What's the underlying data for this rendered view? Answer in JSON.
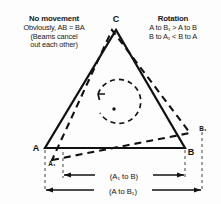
{
  "diagram": {
    "title_implicit": "Sagnac effect triangle — no movement vs rotation",
    "notes": {
      "left": {
        "heading": "No movement",
        "lines": [
          "Obviously, AB = BA",
          "(Beams cancel",
          "out each other)"
        ]
      },
      "right": {
        "heading": "Rotation",
        "lines": [
          "A to B₁ > A to B",
          "B to A₁ < B to A"
        ]
      }
    },
    "vertices": {
      "apex": "C",
      "bottom_left": "A",
      "bottom_left_rotated": "A₁",
      "bottom_right": "B",
      "bottom_right_rotated": "B₁"
    },
    "dimensions": {
      "inner": "(A₁ to B)",
      "outer": "(A to B₁)"
    },
    "rotation_marker": {
      "label": "rotation-arrow",
      "direction": "counterclockwise"
    },
    "colors": {
      "ink": "#111111",
      "background": "#fdfdfd",
      "guide": "#555555"
    }
  }
}
